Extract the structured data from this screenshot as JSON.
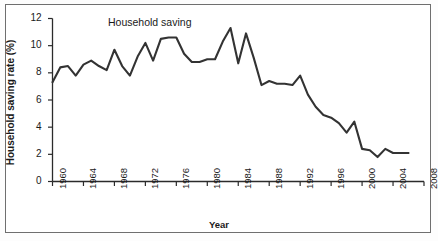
{
  "figure": {
    "annotation": "Household saving",
    "axis_color": "#2b2b2b",
    "line_color": "#333333",
    "frame_color": "#6f6f6f",
    "background": "#ffffff"
  },
  "chart_data": {
    "type": "line",
    "title": "",
    "annotation": "Household saving",
    "xlabel": "Year",
    "ylabel": "Household saving rate (%)",
    "xlim": [
      1960,
      2008
    ],
    "ylim": [
      0,
      12
    ],
    "xticks": [
      1960,
      1964,
      1968,
      1972,
      1976,
      1980,
      1984,
      1988,
      1992,
      1996,
      2000,
      2004,
      2008
    ],
    "yticks": [
      0,
      2,
      4,
      6,
      8,
      10,
      12
    ],
    "xtick_labels": [
      "1960",
      "1964",
      "1968",
      "1972",
      "1976",
      "1980",
      "1984",
      "1988",
      "1992",
      "1996",
      "2000",
      "2004",
      "2008"
    ],
    "ytick_labels": [
      "0",
      "2",
      "4",
      "6",
      "8",
      "10",
      "12"
    ],
    "grid": false,
    "legend": false,
    "series": [
      {
        "name": "Household saving",
        "x": [
          1960,
          1961,
          1962,
          1963,
          1964,
          1965,
          1966,
          1967,
          1968,
          1969,
          1970,
          1971,
          1972,
          1973,
          1974,
          1975,
          1976,
          1977,
          1978,
          1979,
          1980,
          1981,
          1982,
          1983,
          1984,
          1985,
          1986,
          1987,
          1988,
          1989,
          1990,
          1991,
          1992,
          1993,
          1994,
          1995,
          1996,
          1997,
          1998,
          1999,
          2000,
          2001,
          2002,
          2003,
          2004,
          2005,
          2006
        ],
        "values": [
          7.3,
          8.4,
          8.5,
          7.8,
          8.6,
          8.9,
          8.5,
          8.2,
          9.7,
          8.5,
          7.8,
          9.2,
          10.2,
          8.9,
          10.5,
          10.6,
          10.6,
          9.4,
          8.8,
          8.8,
          9.0,
          9.0,
          10.3,
          11.3,
          8.7,
          10.9,
          9.1,
          7.1,
          7.4,
          7.2,
          7.2,
          7.1,
          7.8,
          6.4,
          5.5,
          4.9,
          4.7,
          4.3,
          3.6,
          4.4,
          2.4,
          2.3,
          1.8,
          2.4,
          2.1,
          2.1,
          2.1
        ]
      }
    ]
  }
}
